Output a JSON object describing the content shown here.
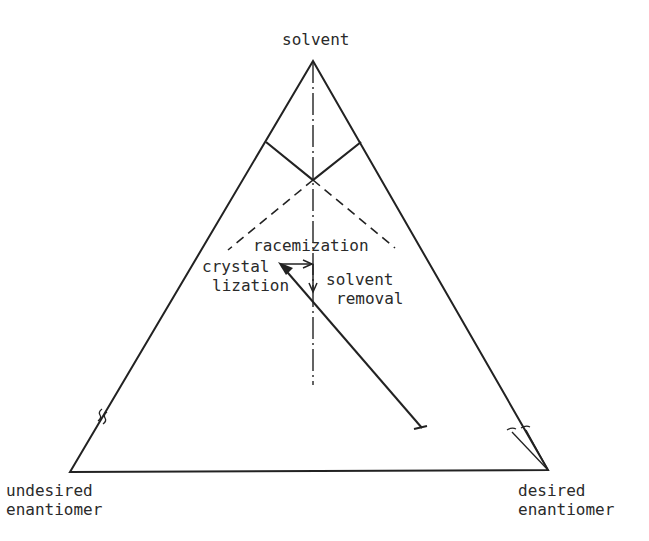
{
  "diagram": {
    "type": "ternary-phase-diagram",
    "vertices": {
      "top": "solvent",
      "bottom_left": [
        "undesired",
        "enantiomer"
      ],
      "bottom_right": [
        "desired",
        "enantiomer"
      ]
    },
    "process_labels": {
      "racemization": "racemization",
      "crystallization": [
        "crystal",
        "lization"
      ],
      "solvent_removal": [
        "solvent",
        "removal"
      ]
    },
    "colors": {
      "line": "#222222",
      "background": "#ffffff"
    }
  }
}
